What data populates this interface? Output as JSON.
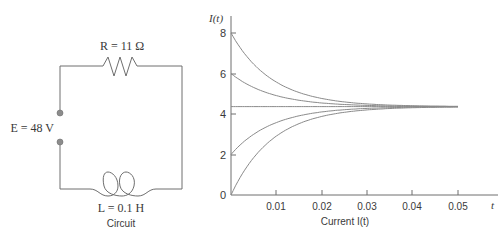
{
  "circuit": {
    "resistor_label": "R = 11 Ω",
    "source_label": "E = 48 V",
    "inductor_label": "L = 0.1 H",
    "caption": "Circuit"
  },
  "chart_data": {
    "type": "line",
    "title": "",
    "xlabel": "Current I(t)",
    "ylabel": "I(t)",
    "x_axis_end_label": "t",
    "xlim": [
      0,
      0.05
    ],
    "ylim": [
      0,
      8
    ],
    "x_ticks": [
      "0.01",
      "0.02",
      "0.03",
      "0.04",
      "0.05"
    ],
    "y_ticks": [
      "0",
      "2",
      "4",
      "6",
      "8"
    ],
    "grid": false,
    "steady_state": 4.3636,
    "time_constant": 0.00909,
    "series": [
      {
        "name": "I(0)=8",
        "initial": 8
      },
      {
        "name": "I(0)=6",
        "initial": 6
      },
      {
        "name": "I(0)=48/11",
        "initial": 4.3636
      },
      {
        "name": "I(0)=2",
        "initial": 2
      },
      {
        "name": "I(0)=0",
        "initial": 0
      }
    ]
  },
  "colors": {
    "wire": "#6e6e6e",
    "curve": "#8a8a8a",
    "text": "#3a3a3a",
    "terminal": "#8c8c8c"
  }
}
